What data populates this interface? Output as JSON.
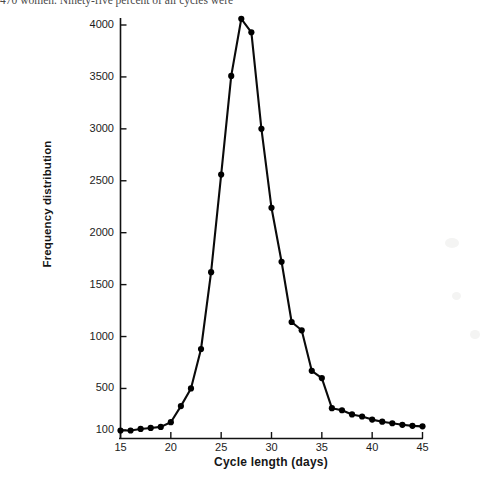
{
  "page": {
    "body_text_fragment": "470 women. Ninety-five percent of all cycles were"
  },
  "chart_data": {
    "type": "line",
    "title": "",
    "xlabel": "Cycle length (days)",
    "ylabel": "Frequency distribution",
    "xlim": [
      15,
      45
    ],
    "ylim": [
      100,
      4100
    ],
    "xticks": [
      15,
      20,
      25,
      30,
      35,
      40,
      45
    ],
    "yticks": [
      100,
      500,
      1000,
      1500,
      2000,
      2500,
      3000,
      3500,
      4000
    ],
    "grid": false,
    "legend": null,
    "marker": "filled-circle",
    "line_color": "#000000",
    "marker_color": "#000000",
    "x": [
      15,
      16,
      17,
      18,
      19,
      20,
      21,
      22,
      23,
      24,
      25,
      26,
      27,
      28,
      29,
      30,
      31,
      32,
      33,
      34,
      35,
      36,
      37,
      38,
      39,
      40,
      41,
      42,
      43,
      44,
      45
    ],
    "values": [
      95,
      95,
      110,
      120,
      130,
      175,
      330,
      500,
      880,
      1620,
      2560,
      3510,
      4060,
      3930,
      3000,
      2240,
      1720,
      1140,
      1060,
      670,
      600,
      310,
      290,
      250,
      230,
      200,
      180,
      165,
      150,
      140,
      135
    ],
    "series": [
      {
        "name": "Cycle length frequency",
        "values": [
          95,
          95,
          110,
          120,
          130,
          175,
          330,
          500,
          880,
          1620,
          2560,
          3510,
          4060,
          3930,
          3000,
          2240,
          1720,
          1140,
          1060,
          670,
          600,
          310,
          290,
          250,
          230,
          200,
          180,
          165,
          150,
          140,
          135
        ]
      }
    ],
    "peak": {
      "x": 27,
      "y": 4060
    }
  }
}
